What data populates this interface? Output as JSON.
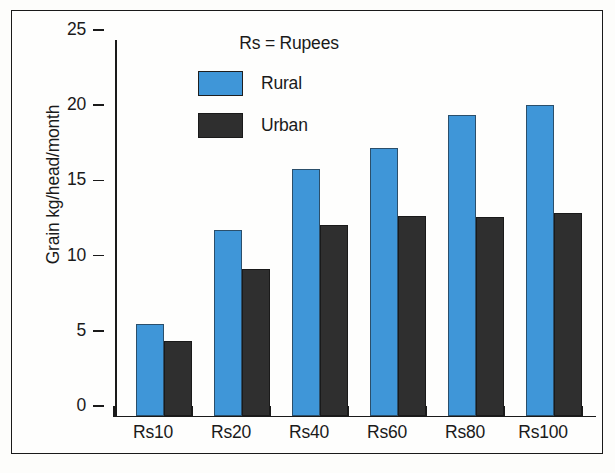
{
  "chart_data": {
    "type": "bar",
    "title": "",
    "subtitle": "",
    "xlabel": "",
    "ylabel": "Grain kg/head/month",
    "categories": [
      "Rs10",
      "Rs20",
      "Rs40",
      "Rs60",
      "Rs80",
      "Rs100"
    ],
    "series": [
      {
        "name": "Rural",
        "color": "#3f96d8",
        "values": [
          6.1,
          12.4,
          16.4,
          17.8,
          20.0,
          20.7
        ]
      },
      {
        "name": "Urban",
        "color": "#2f2f2f",
        "values": [
          5.0,
          9.8,
          12.7,
          13.3,
          13.2,
          13.5
        ]
      }
    ],
    "ylim": [
      0,
      25
    ],
    "yticks": [
      0,
      5,
      10,
      15,
      20,
      25
    ],
    "ytick_labels": [
      "0",
      "5",
      "10",
      "15",
      "20",
      "25"
    ],
    "grid": false,
    "legend_position": "top-center",
    "annotations": [
      "Rs = Rupees"
    ]
  },
  "legend": {
    "title": "Rs = Rupees",
    "entries": [
      {
        "label": "Rural",
        "swatch": "rural"
      },
      {
        "label": "Urban",
        "swatch": "urban"
      }
    ]
  },
  "axes": {
    "y_title": "Grain kg/head/month",
    "y_labels": [
      "25",
      "20",
      "15",
      "10",
      "5",
      "0"
    ],
    "x_labels": [
      "Rs10",
      "Rs20",
      "Rs40",
      "Rs60",
      "Rs80",
      "Rs100"
    ]
  },
  "colors": {
    "rural": "#3f96d8",
    "urban": "#2f2f2f",
    "axis": "#1a1a1a",
    "background": "#fefefd"
  }
}
